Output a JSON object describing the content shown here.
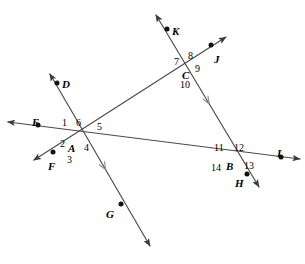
{
  "figure": {
    "type": "geometry-diagram",
    "width": 305,
    "height": 264,
    "background_color": "#ffffff",
    "line_color": "#4a4a4a",
    "label_color": "#000000",
    "top_artifact_text": ""
  },
  "vertices": [
    {
      "id": "A",
      "label": "A",
      "x": 74,
      "y": 135,
      "label_x": 68,
      "label_y": 143
    },
    {
      "id": "B",
      "label": "B",
      "x": 230,
      "y": 152,
      "label_x": 226,
      "label_y": 161
    },
    {
      "id": "C",
      "label": "C",
      "x": 188,
      "y": 62,
      "label_x": 182,
      "label_y": 70
    }
  ],
  "points": [
    {
      "id": "D",
      "label": "D",
      "x": 57,
      "y": 83,
      "label_x": 62,
      "label_y": 79
    },
    {
      "id": "E",
      "label": "E",
      "x": 38,
      "y": 125,
      "label_x": 32,
      "label_y": 117
    },
    {
      "id": "F",
      "label": "F",
      "x": 53,
      "y": 152,
      "label_x": 48,
      "label_y": 161
    },
    {
      "id": "G",
      "label": "G",
      "x": 121,
      "y": 204,
      "label_x": 106,
      "label_y": 209
    },
    {
      "id": "H",
      "label": "H",
      "x": 247,
      "y": 174,
      "label_x": 235,
      "label_y": 178
    },
    {
      "id": "I",
      "label": "I",
      "x": 281,
      "y": 157,
      "label_x": 277,
      "label_y": 148
    },
    {
      "id": "J",
      "label": "J",
      "x": 211,
      "y": 45,
      "label_x": 214,
      "label_y": 54
    },
    {
      "id": "K",
      "label": "K",
      "x": 167,
      "y": 29,
      "label_x": 172,
      "label_y": 26
    }
  ],
  "angle_labels": [
    {
      "id": "angle-1",
      "label": "1",
      "x": 62,
      "y": 118,
      "vertex": "A"
    },
    {
      "id": "angle-2",
      "label": "2",
      "x": 60,
      "y": 139,
      "vertex": "A"
    },
    {
      "id": "angle-3",
      "label": "3",
      "x": 67,
      "y": 155,
      "vertex": "A"
    },
    {
      "id": "angle-4",
      "label": "4",
      "x": 84,
      "y": 143,
      "vertex": "A"
    },
    {
      "id": "angle-5",
      "label": "5",
      "x": 97,
      "y": 122,
      "vertex": "A"
    },
    {
      "id": "angle-6",
      "label": "6",
      "x": 76,
      "y": 118,
      "vertex": "A"
    },
    {
      "id": "angle-7",
      "label": "7",
      "x": 174,
      "y": 57,
      "vertex": "C"
    },
    {
      "id": "angle-8",
      "label": "8",
      "x": 188,
      "y": 51,
      "vertex": "C"
    },
    {
      "id": "angle-9",
      "label": "9",
      "x": 195,
      "y": 64,
      "vertex": "C"
    },
    {
      "id": "angle-10",
      "label": "10",
      "x": 180,
      "y": 80,
      "vertex": "C"
    },
    {
      "id": "angle-11",
      "label": "11",
      "x": 214,
      "y": 143,
      "vertex": "B"
    },
    {
      "id": "angle-12",
      "label": "12",
      "x": 234,
      "y": 143,
      "vertex": "B"
    },
    {
      "id": "angle-13",
      "label": "13",
      "x": 244,
      "y": 161,
      "vertex": "B"
    },
    {
      "id": "angle-14",
      "label": "14",
      "x": 211,
      "y": 163,
      "vertex": "B"
    }
  ],
  "lines": [
    {
      "id": "line-E-I",
      "name": "line-EI",
      "through": [
        "E",
        "A",
        "B",
        "I"
      ],
      "x1": 8,
      "y1": 122,
      "x2": 300,
      "y2": 159,
      "arrow_start": true,
      "arrow_end": true,
      "parallel_mark": false
    },
    {
      "id": "line-D-G",
      "name": "line-DG",
      "through": [
        "D",
        "A",
        "G"
      ],
      "x1": 50,
      "y1": 74,
      "x2": 150,
      "y2": 246,
      "arrow_start": true,
      "arrow_end": true,
      "parallel_mark": true,
      "mark_t": 0.56
    },
    {
      "id": "line-F-J",
      "name": "line-FJ",
      "through": [
        "F",
        "A",
        "C",
        "J"
      ],
      "x1": 34,
      "y1": 160,
      "x2": 226,
      "y2": 37,
      "arrow_start": true,
      "arrow_end": true,
      "parallel_mark": false
    },
    {
      "id": "line-K-H",
      "name": "line-KH",
      "through": [
        "K",
        "C",
        "B",
        "H"
      ],
      "x1": 156,
      "y1": 15,
      "x2": 259,
      "y2": 187,
      "arrow_start": true,
      "arrow_end": true,
      "parallel_mark": true,
      "mark_t": 0.52
    }
  ],
  "relationships": {
    "parallel_pair": [
      "line-D-G",
      "line-K-H"
    ],
    "transversals": [
      "line-E-I",
      "line-F-J"
    ]
  }
}
